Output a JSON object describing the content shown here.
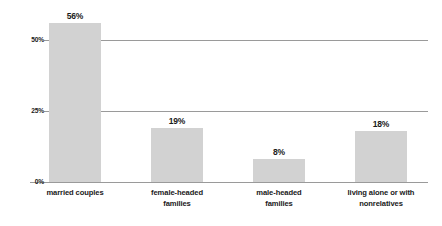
{
  "chart_data": {
    "type": "bar",
    "title": "",
    "subtitle": "",
    "xlabel": "",
    "ylabel": "",
    "categories": [
      "married couples",
      "female-headed families",
      "male-headed families",
      "living alone or with nonrelatives"
    ],
    "category_lines": [
      [
        "married couples"
      ],
      [
        "female-headed",
        "families"
      ],
      [
        "male-headed",
        "families"
      ],
      [
        "living alone or with",
        "nonrelatives"
      ]
    ],
    "values": [
      56,
      19,
      8,
      18
    ],
    "value_labels": [
      "56%",
      "19%",
      "8%",
      "18%"
    ],
    "ylim": [
      0,
      56.5
    ],
    "yticks": [
      0,
      25,
      50
    ],
    "ytick_labels": [
      "0%",
      "25%",
      "50%"
    ],
    "grid": true,
    "grid_axis": "y",
    "legend": false,
    "bar_color": "#d2d2d2",
    "grid_color": "#9a9a9a",
    "text_color": "#1a1a1a",
    "background": "#ffffff"
  }
}
